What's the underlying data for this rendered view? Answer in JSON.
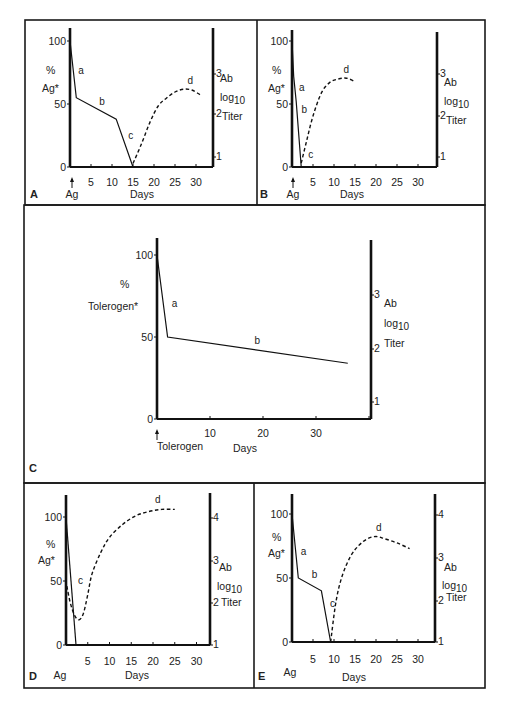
{
  "figure": {
    "width": 506,
    "height": 710,
    "stroke_color": "#111111",
    "background": "#ffffff"
  },
  "chart_data": [
    {
      "panel": "A",
      "type": "line",
      "title": "",
      "xlabel": "Days",
      "ylabel": "% Ag*",
      "y2label": "Ab log10 Titer",
      "x_marker_label": "Ag",
      "xticks": [
        5,
        10,
        15,
        20,
        25,
        30
      ],
      "yticks": [
        0,
        50,
        100
      ],
      "y2ticks": [
        1,
        2,
        3
      ],
      "xlim": [
        0,
        34
      ],
      "ylim": [
        0,
        100
      ],
      "y2lim": [
        0.8,
        3.7
      ],
      "grid": false,
      "series": [
        {
          "name": "antigen",
          "style": "solid",
          "axis": "left",
          "points": [
            [
              0,
              100
            ],
            [
              1.5,
              55
            ],
            [
              11,
              38
            ],
            [
              15,
              0
            ]
          ]
        },
        {
          "name": "antibody",
          "style": "dashed",
          "axis": "right",
          "points": [
            [
              15,
              0.85
            ],
            [
              17,
              1.3
            ],
            [
              19,
              1.8
            ],
            [
              21,
              2.2
            ],
            [
              23,
              2.4
            ],
            [
              25,
              2.55
            ],
            [
              27,
              2.62
            ],
            [
              29,
              2.6
            ],
            [
              31,
              2.48
            ]
          ]
        }
      ],
      "annotations": [
        {
          "text": "a",
          "x": 1.5,
          "y": 74
        },
        {
          "text": "b",
          "x": 6.5,
          "y": 49
        },
        {
          "text": "c",
          "x": 13.4,
          "y": 22
        },
        {
          "text": "d",
          "x": 27.5,
          "y_right": 2.75
        }
      ]
    },
    {
      "panel": "B",
      "type": "line",
      "title": "",
      "xlabel": "Days",
      "ylabel": "% Ag*",
      "y2label": "Ab log10 Titer",
      "x_marker_label": "Ag",
      "xticks": [
        5,
        10,
        15,
        20,
        25,
        30
      ],
      "yticks": [
        0,
        50,
        100
      ],
      "y2ticks": [
        1,
        2,
        3
      ],
      "xlim": [
        0,
        34
      ],
      "ylim": [
        0,
        100
      ],
      "y2lim": [
        0.8,
        3.7
      ],
      "grid": false,
      "series": [
        {
          "name": "antigen",
          "style": "solid",
          "axis": "left",
          "points": [
            [
              0,
              100
            ],
            [
              0.4,
              72
            ],
            [
              1,
              52
            ],
            [
              2.2,
              0
            ]
          ]
        },
        {
          "name": "antibody",
          "style": "dashed",
          "axis": "right",
          "points": [
            [
              2.2,
              0.85
            ],
            [
              3.5,
              1.4
            ],
            [
              5,
              2.0
            ],
            [
              7,
              2.55
            ],
            [
              9,
              2.8
            ],
            [
              11,
              2.88
            ],
            [
              13,
              2.9
            ],
            [
              15,
              2.82
            ]
          ]
        }
      ],
      "annotations": [
        {
          "text": "a",
          "x": 1.2,
          "y": 60
        },
        {
          "text": "b",
          "x": 1.8,
          "y": 43
        },
        {
          "text": "c",
          "x": 3.4,
          "y": 7
        },
        {
          "text": "d",
          "x": 11.8,
          "y_right": 3.03
        }
      ]
    },
    {
      "panel": "C",
      "type": "line",
      "title": "",
      "xlabel": "Days",
      "ylabel": "% Tolerogen*",
      "y2label": "Ab log10 Titer",
      "x_marker_label": "Tolerogen",
      "xticks": [
        10,
        20,
        30
      ],
      "yticks": [
        0,
        50,
        100
      ],
      "y2ticks": [
        1,
        2,
        3
      ],
      "xlim": [
        0,
        40
      ],
      "ylim": [
        0,
        100
      ],
      "y2lim": [
        0.7,
        3.9
      ],
      "grid": false,
      "series": [
        {
          "name": "tolerogen",
          "style": "solid",
          "axis": "left",
          "points": [
            [
              0,
              100
            ],
            [
              2,
              50
            ],
            [
              36,
              34
            ]
          ]
        }
      ],
      "annotations": [
        {
          "text": "a",
          "x": 2.4,
          "y": 68
        },
        {
          "text": "b",
          "x": 18,
          "y": 46
        }
      ]
    },
    {
      "panel": "D",
      "type": "line",
      "title": "",
      "xlabel": "Days",
      "ylabel": "% Ag*",
      "y2label": "Ab log10 Titer",
      "x_marker_label": "Ag",
      "xticks": [
        5,
        10,
        15,
        20,
        25,
        30
      ],
      "yticks": [
        0,
        50,
        100
      ],
      "y2ticks": [
        1,
        2,
        3,
        4
      ],
      "xlim": [
        0,
        33
      ],
      "ylim": [
        0,
        100
      ],
      "y2lim": [
        1,
        4.5
      ],
      "grid": false,
      "series": [
        {
          "name": "antigen",
          "style": "solid",
          "axis": "left",
          "points": [
            [
              0,
              100
            ],
            [
              2.3,
              0
            ]
          ]
        },
        {
          "name": "antibody",
          "style": "dashed",
          "axis": "right",
          "points": [
            [
              0.2,
              2.4
            ],
            [
              1,
              2.0
            ],
            [
              2,
              1.7
            ],
            [
              3,
              1.6
            ],
            [
              4,
              1.75
            ],
            [
              5,
              2.2
            ],
            [
              6,
              2.7
            ],
            [
              8,
              3.2
            ],
            [
              10,
              3.55
            ],
            [
              13,
              3.85
            ],
            [
              16,
              4.05
            ],
            [
              19,
              4.15
            ],
            [
              22,
              4.2
            ],
            [
              25,
              4.2
            ]
          ]
        }
      ],
      "annotations": [
        {
          "text": "c",
          "x": 2.3,
          "y": 48
        },
        {
          "text": "d",
          "x": 20,
          "y_right": 4.35
        }
      ]
    },
    {
      "panel": "E",
      "type": "line",
      "title": "",
      "xlabel": "Days",
      "ylabel": "% Ag*",
      "y2label": "Ab log10 Titer",
      "x_marker_label": "Ag",
      "xticks": [
        5,
        10,
        15,
        20,
        25,
        30
      ],
      "yticks": [
        0,
        50,
        100
      ],
      "y2ticks": [
        1,
        2,
        3,
        4
      ],
      "xlim": [
        0,
        34
      ],
      "ylim": [
        0,
        100
      ],
      "y2lim": [
        1,
        4.5
      ],
      "grid": false,
      "series": [
        {
          "name": "antigen",
          "style": "solid",
          "axis": "left",
          "points": [
            [
              0,
              100
            ],
            [
              1.5,
              50
            ],
            [
              7,
              40
            ],
            [
              9.2,
              0
            ]
          ]
        },
        {
          "name": "antibody",
          "style": "dashed",
          "axis": "right",
          "points": [
            [
              9.2,
              1.0
            ],
            [
              10.5,
              2.0
            ],
            [
              12,
              2.6
            ],
            [
              14,
              3.05
            ],
            [
              16,
              3.3
            ],
            [
              18,
              3.45
            ],
            [
              20,
              3.5
            ],
            [
              22,
              3.45
            ],
            [
              25,
              3.35
            ],
            [
              28,
              3.22
            ]
          ]
        }
      ],
      "annotations": [
        {
          "text": "a",
          "x": 1.6,
          "y": 68
        },
        {
          "text": "b",
          "x": 4.2,
          "y": 50
        },
        {
          "text": "c",
          "x": 8.6,
          "y": 27
        },
        {
          "text": "d",
          "x": 19.5,
          "y_right": 3.62
        }
      ]
    }
  ],
  "labels": {
    "percent": "%",
    "ag_star": "Ag*",
    "tolerogen_star": "Tolerogen*",
    "ab": "Ab",
    "log": "log",
    "log_sub": "10",
    "titer": "Titer",
    "days": "Days",
    "ag": "Ag",
    "tolerogen": "Tolerogen",
    "arrow": "↑"
  }
}
